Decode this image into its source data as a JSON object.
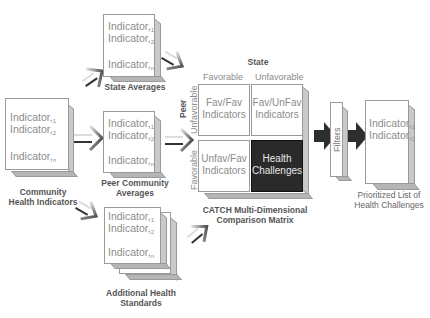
{
  "indicator_word": "Indicator",
  "subscripts": [
    "1",
    "2",
    "n"
  ],
  "community": {
    "label_line1": "Community",
    "label_line2": "Health Indicators"
  },
  "state_averages": {
    "label": "State Averages"
  },
  "peer_averages": {
    "label_line1": "Peer Community",
    "label_line2": "Averages"
  },
  "additional_standards": {
    "label_line1": "Additional Health",
    "label_line2": "Standards"
  },
  "matrix": {
    "top_axis_title": "State",
    "col_headers": [
      "Favorable",
      "Unfavorable"
    ],
    "side_axis_title": "Peer",
    "row_headers": [
      "Unfavorable",
      "Favorable"
    ],
    "cells": [
      {
        "line1": "Fav/Fav",
        "line2": "Indicators"
      },
      {
        "line1": "Fav/UnFav",
        "line2": "Indicators"
      },
      {
        "line1": "Unfav/Fav",
        "line2": "Indicators"
      },
      {
        "line1": "Health",
        "line2": "Challenges"
      }
    ],
    "label_line1": "CATCH Multi-Dimensional",
    "label_line2": "Comparison Matrix"
  },
  "filters": {
    "label": "Filters"
  },
  "prioritized": {
    "label_line1": "Prioritized List of",
    "label_line2": "Health Challenges"
  },
  "colors": {
    "box_border": "#9a9a9a",
    "text_gray": "#8c8c8c",
    "label_dark": "#555555",
    "highlight_cell": "#2a2a2a",
    "arrow_dark": "#333333"
  }
}
